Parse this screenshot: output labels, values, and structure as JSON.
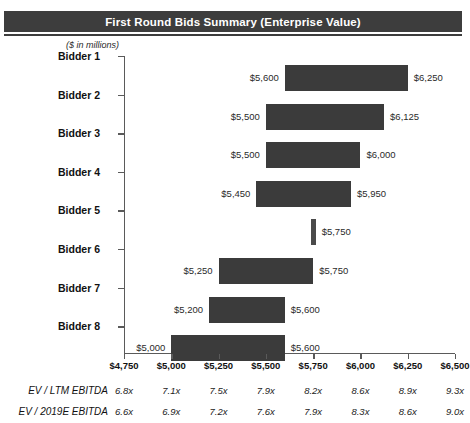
{
  "banner": {
    "title": "First Round Bids Summary (Enterprise Value)"
  },
  "units_note": "($ in millions)",
  "footer": {
    "rows": [
      {
        "label": "EV / LTM EBITDA",
        "values": [
          "6.8x",
          "7.1x",
          "7.5x",
          "7.9x",
          "8.2x",
          "8.6x",
          "8.9x",
          "9.3x"
        ]
      },
      {
        "label": "EV / 2019E EBITDA",
        "values": [
          "6.6x",
          "6.9x",
          "7.2x",
          "7.6x",
          "7.9x",
          "8.3x",
          "8.6x",
          "9.0x"
        ]
      }
    ]
  },
  "colors": {
    "bar": "#3b3b3b",
    "banner": "#3d3d3d",
    "axis": "#5a5a5a"
  },
  "chart_data": {
    "type": "bar",
    "orientation": "horizontal",
    "subtype": "floating-range",
    "title": "First Round Bids Summary (Enterprise Value)",
    "subtitle": "($ in millions)",
    "xlabel": "",
    "ylabel": "",
    "xlim": [
      4750,
      6500
    ],
    "xtick_step": 250,
    "grid": false,
    "legend": false,
    "categories": [
      "Bidder 1",
      "Bidder 2",
      "Bidder 3",
      "Bidder 4",
      "Bidder 5",
      "Bidder 6",
      "Bidder 7",
      "Bidder 8"
    ],
    "tick_labels": [
      "$4,750",
      "$5,000",
      "$5,250",
      "$5,500",
      "$5,750",
      "$6,000",
      "$6,250",
      "$6,500"
    ],
    "tick_values": [
      4750,
      5000,
      5250,
      5500,
      5750,
      6000,
      6250,
      6500
    ],
    "bids": [
      {
        "bidder": "Bidder 1",
        "low": 5600,
        "high": 6250,
        "low_label": "$5,600",
        "high_label": "$6,250"
      },
      {
        "bidder": "Bidder 2",
        "low": 5500,
        "high": 6125,
        "low_label": "$5,500",
        "high_label": "$6,125"
      },
      {
        "bidder": "Bidder 3",
        "low": 5500,
        "high": 6000,
        "low_label": "$5,500",
        "high_label": "$6,000"
      },
      {
        "bidder": "Bidder 4",
        "low": 5450,
        "high": 5950,
        "low_label": "$5,450",
        "high_label": "$5,950"
      },
      {
        "bidder": "Bidder 5",
        "low": 5750,
        "high": 5750,
        "low_label": "",
        "high_label": "$5,750"
      },
      {
        "bidder": "Bidder 6",
        "low": 5250,
        "high": 5750,
        "low_label": "$5,250",
        "high_label": "$5,750"
      },
      {
        "bidder": "Bidder 7",
        "low": 5200,
        "high": 5600,
        "low_label": "$5,200",
        "high_label": "$5,600"
      },
      {
        "bidder": "Bidder 8",
        "low": 5000,
        "high": 5600,
        "low_label": "$5,000",
        "high_label": "$5,600"
      }
    ]
  }
}
